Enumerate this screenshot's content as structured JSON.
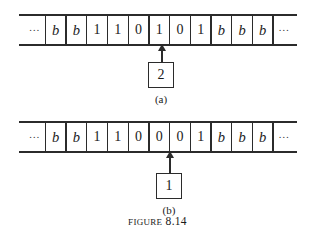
{
  "figure": {
    "caption_word": "Figure",
    "caption_number": "8.14"
  },
  "panels": [
    {
      "id": "a",
      "sublabel": "(a)",
      "state": "2",
      "head_cell_index": 6,
      "tape": [
        "…",
        "b",
        "b",
        "1",
        "1",
        "0",
        "1",
        "0",
        "1",
        "b",
        "b",
        "b",
        "…"
      ]
    },
    {
      "id": "b",
      "sublabel": "(b)",
      "state": "1",
      "head_cell_index": 7,
      "tape": [
        "…",
        "b",
        "b",
        "1",
        "1",
        "0",
        "0",
        "0",
        "1",
        "b",
        "b",
        "b",
        "…"
      ]
    }
  ],
  "colors": {
    "ink": "#2b2b2b",
    "background": "#ffffff"
  }
}
